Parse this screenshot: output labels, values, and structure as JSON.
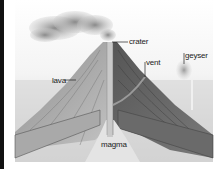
{
  "figure": {
    "labels": {
      "crater": "crater",
      "vent": "vent",
      "geyser": "geyser",
      "lava": "lava",
      "magma": "magma"
    },
    "colors": {
      "background": "#ffffff",
      "ground_light": "#d9d9d9",
      "ground_mid": "#b5b5b5",
      "cone_light": "#9a9a9a",
      "cone_dark": "#5e5e5e",
      "smoke": "#a8a8a8",
      "label_text": "#222222",
      "leader_line": "#222222"
    }
  }
}
